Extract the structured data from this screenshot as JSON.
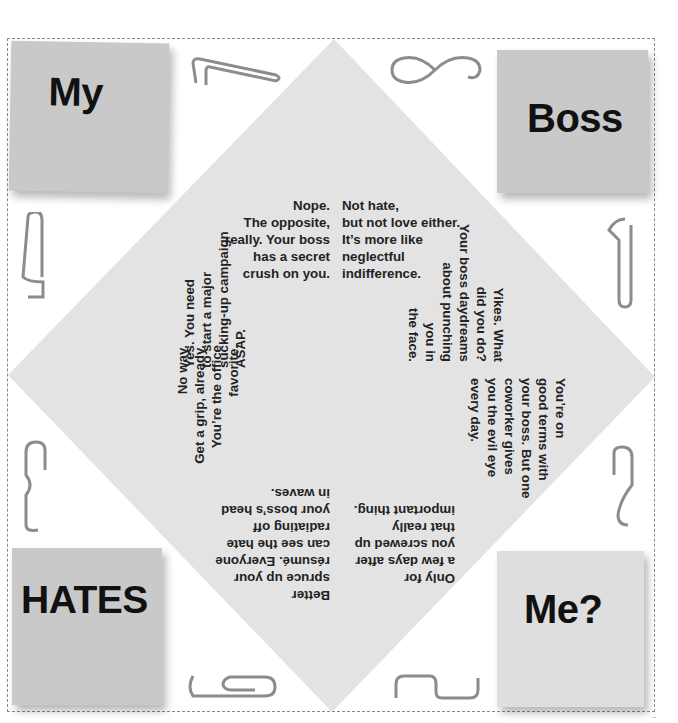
{
  "notes": {
    "top_left": "My",
    "top_right": "Boss",
    "bottom_left": "HATES",
    "bottom_right": "Me?"
  },
  "fortunes": {
    "top_left": [
      "Nope.",
      "The opposite,",
      "really. Your boss",
      "has a secret",
      "crush on you."
    ],
    "top_right": [
      "Not hate,",
      "but not love either.",
      "It’s more like",
      "neglectful",
      "indifference."
    ],
    "right_top": [
      "Yikes. What",
      "did you do?",
      "Your boss daydreams",
      "about punching",
      "you in",
      "the face."
    ],
    "right_bottom": [
      "You’re on",
      "good terms with",
      "your boss. But one",
      "coworker gives",
      "you the evil eye",
      "every day."
    ],
    "bottom_right": [
      "Only for",
      "a few days after",
      "you screwed up",
      "that really",
      "important thing."
    ],
    "bottom_left": [
      "Better",
      "spruce up your",
      "résumé. Everyone",
      "can see the hate",
      "radiating off",
      "your boss’s head",
      "in waves."
    ],
    "left_bottom": [
      "No way.",
      "Get a grip, already.",
      "You’re the office",
      "favorite."
    ],
    "left_top": [
      "Yes. You need",
      "to start a major",
      "sucking-up campaign",
      "ASAP."
    ]
  },
  "colors": {
    "diamond": "#e3e3e3",
    "note_dark": "#c9c9c9",
    "note_light": "#dedede",
    "frame": "#8a8a8a",
    "paperclip": "#8c8c8c"
  },
  "corner_marks": "··"
}
